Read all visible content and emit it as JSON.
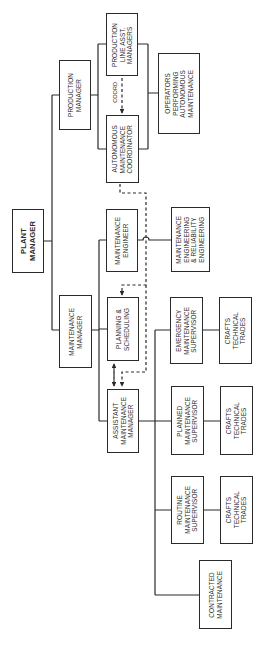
{
  "diagram": {
    "type": "organization-chart",
    "orientation": "rotated-90-ccw",
    "colors": {
      "line": "#2a2a2a",
      "background": "#ffffff"
    },
    "nodes": {
      "plant_manager": "PLANT\nMANAGER",
      "production_manager": "PRODUCTION\nMANAGER",
      "production_line_asst_managers": "PRODUCTION\nLINE ASST.\nMANAGERS",
      "autonomous_maintenance_coordinator": "AUTONOMOUS\nMAINTENANCE\nCOORDINATOR",
      "operators_autonomous_maintenance": "OPERATORS\nPERFORMING\nAUTONOMOUS\nMAINTENANCE",
      "maintenance_manager": "MAINTENANCE\nMANAGER",
      "maintenance_engineer": "MAINTENANCE\nENGINEER",
      "maintenance_reliability_engineering": "MAINTENANCE\nENGINEERING\n& RELIABILITY\nENGINEERING",
      "planning_scheduling": "PLANNING &\nSCHEDULING",
      "assistant_maintenance_manager": "ASSISTANT\nMAINTENANCE\nMANAGER",
      "emergency_maintenance_supervisor": "EMERGENCY\nMAINTENANCE\nSUPERVISOR",
      "planned_maintenance_supervisor": "PLANNED\nMAINTENANCE\nSUPERVISOR",
      "routine_maintenance_supervisor": "ROUTINE\nMAINTENANCE\nSUPERVISOR",
      "crafts_emergency": "CRAFTS\nTECHNICAL\nTRADES",
      "crafts_planned": "CRAFTS\nTECHNICAL\nTRADES",
      "crafts_routine": "CRAFTS\nTECHNICAL\nTRADES",
      "contracted_maintenance": "CONTRACTED\nMAINTENANCE"
    },
    "annotations": {
      "coord": "COORD"
    },
    "edges": [
      {
        "from": "plant_manager",
        "to": "production_manager",
        "style": "solid"
      },
      {
        "from": "plant_manager",
        "to": "maintenance_manager",
        "style": "solid"
      },
      {
        "from": "production_manager",
        "to": "production_line_asst_managers",
        "style": "solid"
      },
      {
        "from": "production_manager",
        "to": "autonomous_maintenance_coordinator",
        "style": "solid"
      },
      {
        "from": "production_line_asst_managers",
        "to": "operators_autonomous_maintenance",
        "style": "solid"
      },
      {
        "from": "autonomous_maintenance_coordinator",
        "to": "operators_autonomous_maintenance",
        "style": "solid"
      },
      {
        "from": "production_line_asst_managers",
        "to": "autonomous_maintenance_coordinator",
        "style": "dashed",
        "label": "COORD"
      },
      {
        "from": "maintenance_manager",
        "to": "maintenance_engineer",
        "style": "solid"
      },
      {
        "from": "maintenance_manager",
        "to": "planning_scheduling",
        "style": "solid"
      },
      {
        "from": "maintenance_manager",
        "to": "assistant_maintenance_manager",
        "style": "solid"
      },
      {
        "from": "maintenance_engineer",
        "to": "maintenance_reliability_engineering",
        "style": "solid"
      },
      {
        "from": "assistant_maintenance_manager",
        "to": "emergency_maintenance_supervisor",
        "style": "solid"
      },
      {
        "from": "assistant_maintenance_manager",
        "to": "planned_maintenance_supervisor",
        "style": "solid"
      },
      {
        "from": "assistant_maintenance_manager",
        "to": "routine_maintenance_supervisor",
        "style": "solid"
      },
      {
        "from": "assistant_maintenance_manager",
        "to": "contracted_maintenance",
        "style": "solid"
      },
      {
        "from": "emergency_maintenance_supervisor",
        "to": "crafts_emergency",
        "style": "solid"
      },
      {
        "from": "planned_maintenance_supervisor",
        "to": "crafts_planned",
        "style": "solid"
      },
      {
        "from": "routine_maintenance_supervisor",
        "to": "crafts_routine",
        "style": "solid"
      },
      {
        "from": "autonomous_maintenance_coordinator",
        "to": "planning_scheduling",
        "style": "dashed"
      },
      {
        "from": "autonomous_maintenance_coordinator",
        "to": "assistant_maintenance_manager",
        "style": "dashed"
      },
      {
        "from": "planning_scheduling",
        "to": "assistant_maintenance_manager",
        "style": "dashed",
        "bidirectional": true
      }
    ]
  }
}
